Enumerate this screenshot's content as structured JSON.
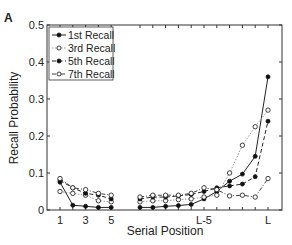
{
  "panel_label": "A",
  "chart_data": {
    "type": "line",
    "title": "",
    "xlabel": "Serial Position",
    "ylabel": "Recall Probability",
    "ylim": [
      0,
      0.5
    ],
    "yticks": [
      0,
      0.1,
      0.2,
      0.3,
      0.4,
      0.5
    ],
    "ytick_labels": [
      "0",
      "0.1",
      "0.2",
      "0.3",
      "0.4",
      "0.5"
    ],
    "xtick_labels": [
      "1",
      "3",
      "5",
      "L-5",
      "L"
    ],
    "grid": false,
    "legend_position": "upper-left",
    "x_left": [
      1,
      2,
      3,
      4,
      5
    ],
    "x_right": [
      "L-10",
      "L-9",
      "L-8",
      "L-7",
      "L-6",
      "L-5",
      "L-4",
      "L-3",
      "L-2",
      "L-1",
      "L"
    ],
    "series": [
      {
        "name": "1st Recall",
        "style": "solid",
        "marker": "filled",
        "left": [
          0.075,
          0.013,
          0.01,
          0.007,
          0.007
        ],
        "right": [
          0.007,
          0.007,
          0.01,
          0.012,
          0.015,
          0.03,
          0.05,
          0.078,
          0.097,
          0.145,
          0.36
        ]
      },
      {
        "name": "3rd Recall",
        "style": "dotted",
        "marker": "open",
        "left": [
          0.05,
          0.045,
          0.04,
          0.025,
          0.022
        ],
        "right": [
          0.022,
          0.025,
          0.025,
          0.028,
          0.03,
          0.035,
          0.04,
          0.1,
          0.175,
          0.225,
          0.27
        ]
      },
      {
        "name": "5th Recall",
        "style": "dashed",
        "marker": "filled",
        "left": [
          0.08,
          0.06,
          0.045,
          0.04,
          0.03
        ],
        "right": [
          0.03,
          0.035,
          0.035,
          0.038,
          0.042,
          0.05,
          0.06,
          0.065,
          0.07,
          0.09,
          0.24
        ]
      },
      {
        "name": "7th Recall",
        "style": "dashdot",
        "marker": "open",
        "left": [
          0.085,
          0.06,
          0.055,
          0.045,
          0.04
        ],
        "right": [
          0.035,
          0.04,
          0.04,
          0.04,
          0.045,
          0.06,
          0.055,
          0.038,
          0.04,
          0.035,
          0.085
        ]
      }
    ]
  }
}
